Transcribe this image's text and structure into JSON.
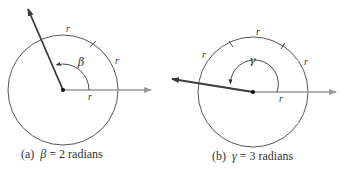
{
  "figure_a": {
    "caption_prefix": "(a)",
    "symbol": "β",
    "caption_suffix": "= 2 radians",
    "angle_radians": 2,
    "arc_labels": [
      "r",
      "r",
      "r"
    ],
    "angle_label": "β"
  },
  "figure_b": {
    "caption_prefix": "(b)",
    "symbol": "γ",
    "caption_suffix": "= 3 radians",
    "angle_radians": 3,
    "arc_labels": [
      "r",
      "r",
      "r",
      "r"
    ],
    "angle_label": "γ"
  },
  "colors": {
    "circle": "#444444",
    "initial_ray": "#9a9a9a",
    "terminal_ray": "#3a3a3a",
    "text": "#333333"
  }
}
